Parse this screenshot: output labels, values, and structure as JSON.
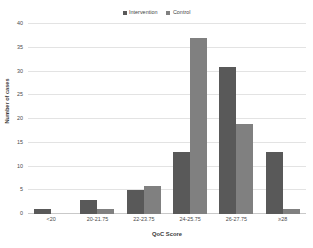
{
  "chart_data": {
    "type": "bar",
    "title": "",
    "subtitle": "",
    "xlabel": "QoC Score",
    "ylabel": "Number  of cases",
    "categories": [
      "<20",
      "20-21.75",
      "22-23.75",
      "24-25.75",
      "26-27.75",
      "≥28"
    ],
    "series": [
      {
        "name": "Intervention",
        "color": "#595959",
        "values": [
          1,
          3,
          5,
          13,
          31,
          13
        ]
      },
      {
        "name": "Control",
        "color": "#808080",
        "values": [
          0,
          1,
          6,
          37,
          19,
          1
        ]
      }
    ],
    "ylim": [
      0,
      40
    ],
    "ytick_values": [
      0,
      5,
      10,
      15,
      20,
      25,
      30,
      35,
      40
    ],
    "ytick_labels": [
      "0",
      "5",
      "10",
      "15",
      "20",
      "25",
      "30",
      "35",
      "40"
    ],
    "grid": "horizontal",
    "legend_position": "top-center",
    "gridline_color": "#e3e3e3",
    "axis_color": "#c9c9c9",
    "background": "#ffffff"
  },
  "legend": {
    "entries": [
      {
        "label": "Intervention",
        "color": "#595959"
      },
      {
        "label": "Control",
        "color": "#808080"
      }
    ]
  }
}
